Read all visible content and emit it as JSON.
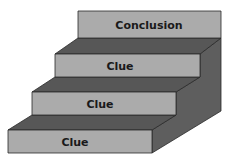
{
  "diagram": {
    "type": "staircase",
    "steps": [
      {
        "label": "Conclusion",
        "level": 4
      },
      {
        "label": "Clue",
        "level": 3
      },
      {
        "label": "Clue",
        "level": 2
      },
      {
        "label": "Clue",
        "level": 1
      }
    ],
    "colors": {
      "face": "#ababab",
      "tread": "#575757",
      "side": "#5e5e5e",
      "outline": "#2a2a2a",
      "text": "#1a1a1a"
    }
  }
}
